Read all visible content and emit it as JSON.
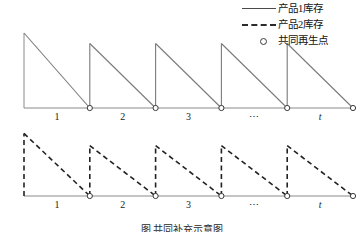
{
  "legend": {
    "items": [
      {
        "label": "产品1库存",
        "marker": "solid-line",
        "icon_name": "solid-line-icon"
      },
      {
        "label": "产品2库存",
        "marker": "dashed-line",
        "icon_name": "dashed-line-icon"
      },
      {
        "label": "共同再生点",
        "marker": "circle",
        "icon_name": "circle-marker-icon"
      }
    ]
  },
  "caption": {
    "text": "图    共同补充示意图"
  },
  "colors": {
    "series1": "#7a7a7a",
    "series2": "#222222",
    "axis": "#8a8a8a",
    "marker_stroke": "#3a3a3a",
    "background": "#ffffff"
  },
  "chart_data": [
    {
      "type": "line",
      "name": "产品1库存",
      "title": "",
      "xlabel": "",
      "ylabel": "",
      "legend_position": "top-right",
      "grid": false,
      "linestyle": "solid",
      "xlim": [
        0,
        10
      ],
      "ylim": [
        0,
        1
      ],
      "x_tick_labels": [
        "1",
        "2",
        "3",
        "⋯",
        "t"
      ],
      "x_tick_positions": [
        1.0,
        3.0,
        5.0,
        7.0,
        9.0
      ],
      "description": "锯齿形库存曲线：瞬时补货后库存线性消耗至零，周期重复5次",
      "cycles": [
        {
          "start_x": 0.0,
          "peak_y": 1.0,
          "end_x": 2.0
        },
        {
          "start_x": 2.0,
          "peak_y": 0.86,
          "end_x": 4.0
        },
        {
          "start_x": 4.0,
          "peak_y": 0.86,
          "end_x": 6.0
        },
        {
          "start_x": 6.0,
          "peak_y": 0.86,
          "end_x": 8.0
        },
        {
          "start_x": 8.0,
          "peak_y": 0.86,
          "end_x": 10.0
        }
      ],
      "replenishment_points_x": [
        2.0,
        4.0,
        6.0,
        8.0,
        10.0
      ]
    },
    {
      "type": "line",
      "name": "产品2库存",
      "title": "",
      "xlabel": "",
      "ylabel": "",
      "legend_position": "top-right",
      "grid": false,
      "linestyle": "dashed",
      "xlim": [
        0,
        10
      ],
      "ylim": [
        0,
        1
      ],
      "x_tick_labels": [
        "1",
        "2",
        "3",
        "⋯",
        "t"
      ],
      "x_tick_positions": [
        1.0,
        3.0,
        5.0,
        7.0,
        9.0
      ],
      "description": "锯齿形库存曲线（虚线）：与产品1共享再生点，峰值较低",
      "cycles": [
        {
          "start_x": 0.0,
          "peak_y": 0.92,
          "end_x": 2.0
        },
        {
          "start_x": 2.0,
          "peak_y": 0.74,
          "end_x": 4.0
        },
        {
          "start_x": 4.0,
          "peak_y": 0.74,
          "end_x": 6.0
        },
        {
          "start_x": 6.0,
          "peak_y": 0.74,
          "end_x": 8.0
        },
        {
          "start_x": 8.0,
          "peak_y": 0.74,
          "end_x": 10.0
        }
      ],
      "replenishment_points_x": [
        2.0,
        4.0,
        6.0,
        8.0,
        10.0
      ]
    }
  ]
}
